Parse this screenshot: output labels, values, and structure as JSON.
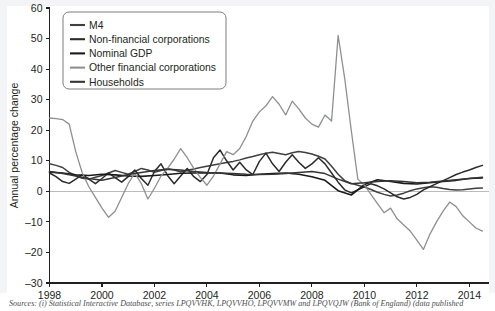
{
  "chart_data": {
    "type": "line",
    "title": "",
    "subtitle": "",
    "xlabel": "",
    "ylabel": "Annual percentage change",
    "xlim": [
      1998,
      2014.75
    ],
    "ylim": [
      -30,
      60
    ],
    "ytick_step": 10,
    "xtick_step": 2,
    "grid": false,
    "zero_line": true,
    "legend_position": "top-left-inside",
    "xticks": [
      "1998",
      "2000",
      "2002",
      "2004",
      "2006",
      "2008",
      "2010",
      "2012",
      "2014"
    ],
    "yticks": [
      "60",
      "50",
      "40",
      "30",
      "20",
      "10",
      "0",
      "-10",
      "-20",
      "-30"
    ],
    "series": [
      {
        "name": "M4",
        "color": "#3f3f3f",
        "width": 1.5,
        "x": [
          1998.0,
          1998.25,
          1998.5,
          1998.75,
          1999.0,
          1999.25,
          1999.5,
          1999.75,
          2000.0,
          2000.25,
          2000.5,
          2000.75,
          2001.0,
          2001.25,
          2001.5,
          2001.75,
          2002.0,
          2002.25,
          2002.5,
          2002.75,
          2003.0,
          2003.25,
          2003.5,
          2003.75,
          2004.0,
          2004.25,
          2004.5,
          2004.75,
          2005.0,
          2005.25,
          2005.5,
          2005.75,
          2006.0,
          2006.25,
          2006.5,
          2006.75,
          2007.0,
          2007.25,
          2007.5,
          2007.75,
          2008.0,
          2008.25,
          2008.5,
          2008.75,
          2009.0,
          2009.25,
          2009.5,
          2009.75,
          2010.0,
          2010.25,
          2010.5,
          2010.75,
          2011.0,
          2011.25,
          2011.5,
          2011.75,
          2012.0,
          2012.25,
          2012.5,
          2012.75,
          2013.0,
          2013.25,
          2013.5,
          2013.75,
          2014.0,
          2014.25,
          2014.5
        ],
        "values": [
          9.0,
          8.5,
          7.8,
          6.2,
          5.1,
          4.3,
          4.0,
          4.6,
          5.2,
          6.0,
          6.8,
          6.2,
          5.6,
          6.5,
          7.5,
          7.0,
          6.2,
          6.8,
          7.4,
          7.0,
          6.4,
          6.9,
          7.3,
          7.8,
          8.2,
          8.6,
          9.0,
          9.4,
          9.8,
          10.3,
          10.9,
          11.4,
          12.0,
          12.5,
          12.8,
          12.4,
          12.0,
          12.6,
          13.0,
          12.7,
          12.2,
          11.5,
          10.6,
          8.2,
          5.6,
          3.5,
          2.6,
          2.0,
          1.4,
          0.6,
          -0.3,
          -1.0,
          -1.5,
          -1.2,
          -0.6,
          0.2,
          0.8,
          1.2,
          1.5,
          1.3,
          0.9,
          0.6,
          0.4,
          0.5,
          0.8,
          1.0,
          1.1
        ]
      },
      {
        "name": "Non-financial corporations",
        "color": "#2b2b2b",
        "width": 1.5,
        "x": [
          1998.0,
          1998.25,
          1998.5,
          1998.75,
          1999.0,
          1999.25,
          1999.5,
          1999.75,
          2000.0,
          2000.25,
          2000.5,
          2000.75,
          2001.0,
          2001.25,
          2001.5,
          2001.75,
          2002.0,
          2002.25,
          2002.5,
          2002.75,
          2003.0,
          2003.25,
          2003.5,
          2003.75,
          2004.0,
          2004.25,
          2004.5,
          2004.75,
          2005.0,
          2005.25,
          2005.5,
          2005.75,
          2006.0,
          2006.25,
          2006.5,
          2006.75,
          2007.0,
          2007.25,
          2007.5,
          2007.75,
          2008.0,
          2008.25,
          2008.5,
          2008.75,
          2009.0,
          2009.25,
          2009.5,
          2009.75,
          2010.0,
          2010.25,
          2010.5,
          2010.75,
          2011.0,
          2011.25,
          2011.5,
          2011.75,
          2012.0,
          2012.25,
          2012.5,
          2012.75,
          2013.0,
          2013.25,
          2013.5,
          2013.75,
          2014.0,
          2014.25,
          2014.5
        ],
        "values": [
          6.0,
          4.8,
          3.2,
          2.6,
          4.0,
          5.5,
          4.0,
          2.5,
          4.2,
          6.0,
          4.5,
          3.0,
          4.8,
          7.0,
          4.2,
          2.0,
          6.5,
          9.0,
          5.2,
          2.5,
          5.0,
          7.5,
          4.8,
          3.2,
          5.5,
          11.0,
          13.5,
          10.0,
          7.0,
          9.5,
          7.0,
          5.5,
          9.8,
          12.5,
          9.0,
          6.5,
          9.5,
          12.0,
          9.5,
          7.5,
          9.0,
          11.0,
          9.0,
          6.0,
          3.0,
          0.5,
          -0.5,
          0.5,
          1.5,
          2.5,
          1.8,
          0.8,
          -0.5,
          -1.8,
          -2.5,
          -2.0,
          -1.0,
          0.5,
          1.5,
          2.5,
          3.5,
          4.5,
          5.5,
          6.3,
          7.0,
          7.8,
          8.5
        ]
      },
      {
        "name": "Nominal GDP",
        "color": "#1a1a1a",
        "width": 1.6,
        "x": [
          1998.0,
          1998.5,
          1999.0,
          1999.5,
          2000.0,
          2000.5,
          2001.0,
          2001.5,
          2002.0,
          2002.5,
          2003.0,
          2003.5,
          2004.0,
          2004.5,
          2005.0,
          2005.5,
          2006.0,
          2006.5,
          2007.0,
          2007.5,
          2008.0,
          2008.5,
          2009.0,
          2009.5,
          2010.0,
          2010.5,
          2011.0,
          2011.5,
          2012.0,
          2012.5,
          2013.0,
          2013.5,
          2014.0,
          2014.5
        ],
        "values": [
          6.3,
          6.0,
          5.4,
          5.2,
          5.6,
          5.4,
          5.0,
          4.9,
          5.2,
          5.5,
          5.9,
          6.0,
          6.1,
          6.0,
          5.4,
          5.2,
          5.6,
          5.8,
          6.0,
          5.6,
          4.8,
          3.6,
          0.2,
          -1.2,
          2.2,
          3.8,
          3.2,
          2.6,
          2.4,
          2.8,
          3.2,
          3.6,
          4.2,
          4.4
        ]
      },
      {
        "name": "Other financial corporations",
        "color": "#8d8f91",
        "width": 1.3,
        "x": [
          1998.0,
          1998.25,
          1998.5,
          1998.75,
          1999.0,
          1999.25,
          1999.5,
          1999.75,
          2000.0,
          2000.25,
          2000.5,
          2000.75,
          2001.0,
          2001.25,
          2001.5,
          2001.75,
          2002.0,
          2002.25,
          2002.5,
          2002.75,
          2003.0,
          2003.25,
          2003.5,
          2003.75,
          2004.0,
          2004.25,
          2004.5,
          2004.75,
          2005.0,
          2005.25,
          2005.5,
          2005.75,
          2006.0,
          2006.25,
          2006.5,
          2006.75,
          2007.0,
          2007.25,
          2007.5,
          2007.75,
          2008.0,
          2008.25,
          2008.5,
          2008.75,
          2009.0,
          2009.25,
          2009.5,
          2009.75,
          2010.0,
          2010.25,
          2010.5,
          2010.75,
          2011.0,
          2011.25,
          2011.5,
          2011.75,
          2012.0,
          2012.25,
          2012.5,
          2012.75,
          2013.0,
          2013.25,
          2013.5,
          2013.75,
          2014.0,
          2014.25,
          2014.5
        ],
        "values": [
          24.0,
          23.8,
          23.5,
          22.0,
          13.0,
          6.0,
          1.5,
          -2.0,
          -5.5,
          -8.5,
          -6.5,
          -2.0,
          2.5,
          6.0,
          2.5,
          -2.5,
          1.0,
          5.0,
          7.5,
          10.5,
          14.0,
          11.0,
          7.5,
          4.5,
          2.0,
          5.0,
          9.0,
          13.0,
          12.0,
          14.0,
          18.0,
          23.0,
          26.0,
          28.0,
          31.0,
          28.5,
          25.0,
          29.5,
          27.0,
          24.0,
          22.0,
          21.0,
          25.0,
          23.0,
          51.0,
          37.0,
          20.0,
          4.0,
          2.0,
          -1.0,
          -4.0,
          -7.0,
          -5.5,
          -9.0,
          -11.0,
          -13.0,
          -16.0,
          -19.0,
          -14.0,
          -10.0,
          -6.5,
          -3.5,
          -5.0,
          -8.0,
          -10.0,
          -12.0,
          -13.0
        ]
      },
      {
        "name": "Households",
        "color": "#343434",
        "width": 1.5,
        "x": [
          1998.0,
          1998.5,
          1999.0,
          1999.5,
          2000.0,
          2000.5,
          2001.0,
          2001.5,
          2002.0,
          2002.5,
          2003.0,
          2003.5,
          2004.0,
          2004.5,
          2005.0,
          2005.5,
          2006.0,
          2006.5,
          2007.0,
          2007.5,
          2008.0,
          2008.5,
          2009.0,
          2009.5,
          2010.0,
          2010.5,
          2011.0,
          2011.5,
          2012.0,
          2012.5,
          2013.0,
          2013.5,
          2014.0,
          2014.5
        ],
        "values": [
          6.5,
          5.8,
          5.0,
          4.2,
          3.6,
          4.5,
          5.5,
          6.2,
          6.8,
          7.2,
          7.0,
          6.5,
          6.2,
          6.0,
          5.8,
          5.6,
          5.5,
          5.6,
          5.8,
          6.2,
          6.5,
          5.8,
          4.0,
          2.5,
          2.8,
          3.2,
          3.5,
          3.2,
          2.8,
          3.0,
          3.4,
          3.8,
          4.2,
          4.6
        ]
      }
    ]
  },
  "source": {
    "text": "Sources: (i) Statistical Interactive Database, series LPQVVHK, LPQVVHO, LPQVVMW and LPQVQJW (Bank of England) (data published"
  },
  "legend": {
    "items": [
      {
        "label": "M4"
      },
      {
        "label": "Non-financial corporations"
      },
      {
        "label": "Nominal GDP"
      },
      {
        "label": "Other financial corporations"
      },
      {
        "label": "Households"
      }
    ]
  }
}
